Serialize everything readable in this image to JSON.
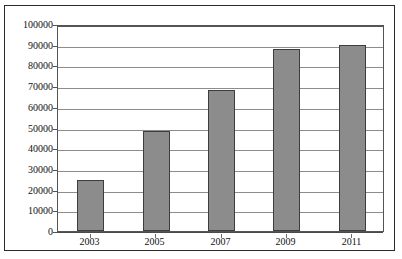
{
  "chart_data": {
    "type": "bar",
    "title": "",
    "subtitle": "",
    "xlabel": "",
    "ylabel": "",
    "categories": [
      "2003",
      "2005",
      "2007",
      "2009",
      "2011"
    ],
    "values": [
      24500,
      48500,
      68000,
      88000,
      90000
    ],
    "series": [
      {
        "name": "",
        "values": [
          24500,
          48500,
          68000,
          88000,
          90000
        ]
      }
    ],
    "ylim": [
      0,
      100000
    ],
    "ytick_labels": [
      "100000",
      "90000",
      "80000",
      "70000",
      "60000",
      "50000",
      "40000",
      "30000",
      "20000",
      "10000",
      "0"
    ],
    "ytick_values": [
      100000,
      90000,
      80000,
      70000,
      60000,
      50000,
      40000,
      30000,
      20000,
      10000,
      0
    ],
    "ytick_step": 10000,
    "grid": true,
    "grid_axis": "y",
    "legend": false,
    "legend_position": "none",
    "annotations": [],
    "colors": {
      "bar_fill": "#8c8c8c",
      "bar_border": "#3d3d3d",
      "gridline": "#8c8c8c",
      "axis": "#555555",
      "frame": "#2b2b2b",
      "text": "#111111",
      "background": "#ffffff"
    }
  }
}
